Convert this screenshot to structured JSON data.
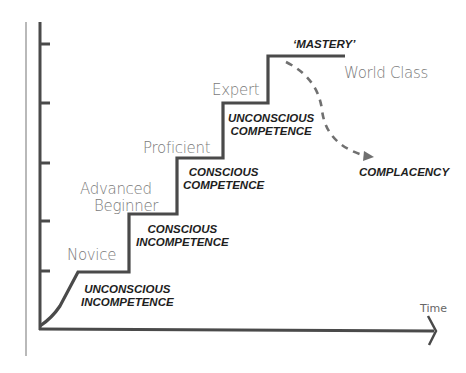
{
  "diagram": {
    "type": "staircase-progression",
    "x_axis_label": "Time",
    "colors": {
      "line": "#4a4a4a",
      "stage_text": "#7a7a7a",
      "phase_text": "#1e1e1e",
      "dashed": "#707070",
      "background": "#ffffff"
    },
    "stages": [
      {
        "label": "Novice",
        "phase_line1": "UNCONSCIOUS",
        "phase_line2": "INCOMPETENCE"
      },
      {
        "label": "Advanced",
        "label_line2": "Beginner",
        "phase_line1": "CONSCIOUS",
        "phase_line2": "INCOMPETENCE"
      },
      {
        "label": "Proficient",
        "phase_line1": "CONSCIOUS",
        "phase_line2": "COMPETENCE"
      },
      {
        "label": "Expert",
        "phase_line1": "UNCONSCIOUS",
        "phase_line2": "COMPETENCE"
      },
      {
        "label": "World Class",
        "phase_line1": "‘MASTERY’"
      }
    ],
    "decline": {
      "label": "COMPLACENCY"
    }
  }
}
